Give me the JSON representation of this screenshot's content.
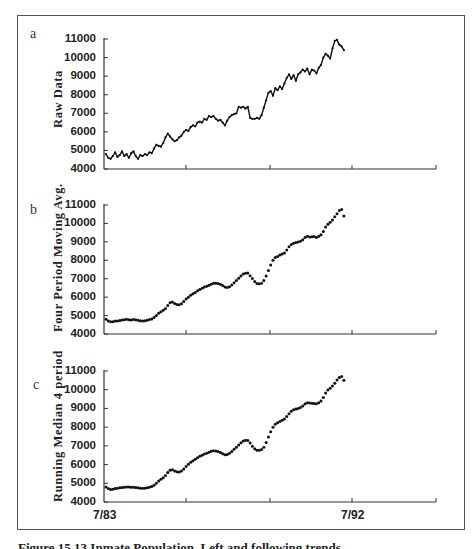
{
  "figure": {
    "caption": "Figure 15.13 Inmate Population, Left and following trends"
  },
  "chart_data": [
    {
      "type": "line",
      "panel": "a",
      "ylabel": "Raw Data",
      "xlabel": "",
      "ylim": [
        4000,
        11000
      ],
      "yticks": [
        4000,
        5000,
        6000,
        7000,
        8000,
        9000,
        10000,
        11000
      ],
      "x_start": "7/83",
      "x_tick_labels": [
        "7/83",
        "",
        "",
        "7/92",
        ""
      ],
      "grid": false,
      "series": [
        {
          "name": "Raw Data",
          "frequency": "monthly",
          "start": "7/83",
          "values": [
            4800,
            4600,
            4550,
            4700,
            4900,
            4650,
            4750,
            4950,
            4700,
            4800,
            4600,
            4850,
            4950,
            4700,
            4550,
            4750,
            4700,
            4800,
            4750,
            4900,
            4850,
            5100,
            5300,
            5250,
            5200,
            5400,
            5700,
            5900,
            5750,
            5600,
            5500,
            5550,
            5700,
            5800,
            6000,
            6100,
            6050,
            6250,
            6350,
            6300,
            6500,
            6550,
            6500,
            6700,
            6650,
            6850,
            6800,
            6850,
            6700,
            6600,
            6650,
            6500,
            6350,
            6600,
            6800,
            6900,
            6950,
            7000,
            7350,
            7300,
            7350,
            7250,
            7350,
            6750,
            6700,
            6700,
            6750,
            6700,
            6900,
            7300,
            7700,
            8100,
            8200,
            7950,
            8350,
            8250,
            8450,
            8300,
            8600,
            8900,
            9100,
            8850,
            9050,
            8750,
            9100,
            9200,
            9350,
            9250,
            9400,
            9100,
            9350,
            9300,
            9150,
            9450,
            9600,
            10000,
            10200,
            10100,
            9950,
            10500,
            10900,
            10950,
            10700,
            10600,
            10400
          ]
        }
      ]
    },
    {
      "type": "scatter",
      "panel": "b",
      "ylabel": "Four Period Moving Avg.",
      "xlabel": "",
      "ylim": [
        4000,
        11000
      ],
      "yticks": [
        4000,
        5000,
        6000,
        7000,
        8000,
        9000,
        10000,
        11000
      ],
      "x_start": "7/83",
      "x_tick_labels": [
        "7/83",
        "",
        "",
        "7/92",
        ""
      ],
      "grid": false,
      "series": [
        {
          "name": "Four Period Moving Avg.",
          "frequency": "monthly",
          "start": "7/83",
          "values": [
            4800,
            4700,
            4660,
            4670,
            4700,
            4700,
            4730,
            4760,
            4780,
            4800,
            4780,
            4760,
            4790,
            4780,
            4740,
            4720,
            4700,
            4720,
            4750,
            4790,
            4820,
            4900,
            5010,
            5120,
            5210,
            5290,
            5390,
            5550,
            5700,
            5730,
            5660,
            5600,
            5590,
            5640,
            5760,
            5900,
            6000,
            6100,
            6190,
            6250,
            6350,
            6420,
            6480,
            6550,
            6590,
            6650,
            6700,
            6760,
            6750,
            6740,
            6700,
            6630,
            6550,
            6530,
            6570,
            6660,
            6780,
            6900,
            7020,
            7150,
            7250,
            7300,
            7310,
            7160,
            7010,
            6850,
            6740,
            6720,
            6760,
            6900,
            7150,
            7450,
            7750,
            8000,
            8150,
            8200,
            8290,
            8340,
            8400,
            8560,
            8730,
            8860,
            8930,
            8960,
            8990,
            9030,
            9110,
            9230,
            9300,
            9270,
            9280,
            9290,
            9230,
            9300,
            9380,
            9560,
            9810,
            9960,
            10060,
            10190,
            10360,
            10530,
            10700,
            10760,
            10400
          ]
        }
      ]
    },
    {
      "type": "scatter",
      "panel": "c",
      "ylabel": "Running Median 4 period",
      "xlabel": "",
      "ylim": [
        4000,
        11000
      ],
      "yticks": [
        4000,
        5000,
        6000,
        7000,
        8000,
        9000,
        10000,
        11000
      ],
      "x_start": "7/83",
      "x_tick_labels": [
        "7/83",
        "",
        "",
        "7/92",
        ""
      ],
      "grid": false,
      "series": [
        {
          "name": "Running Median 4 period",
          "frequency": "monthly",
          "start": "7/83",
          "values": [
            4800,
            4720,
            4670,
            4680,
            4720,
            4740,
            4760,
            4780,
            4790,
            4800,
            4800,
            4790,
            4790,
            4780,
            4760,
            4740,
            4730,
            4740,
            4760,
            4790,
            4830,
            4900,
            5000,
            5120,
            5220,
            5300,
            5420,
            5580,
            5700,
            5720,
            5660,
            5610,
            5600,
            5650,
            5760,
            5900,
            6020,
            6130,
            6210,
            6280,
            6360,
            6440,
            6500,
            6560,
            6610,
            6660,
            6710,
            6740,
            6730,
            6700,
            6650,
            6580,
            6530,
            6540,
            6600,
            6700,
            6820,
            6930,
            7050,
            7170,
            7260,
            7300,
            7290,
            7150,
            6980,
            6850,
            6770,
            6760,
            6800,
            6930,
            7180,
            7470,
            7760,
            8000,
            8160,
            8230,
            8300,
            8370,
            8440,
            8570,
            8720,
            8850,
            8930,
            8970,
            9000,
            9050,
            9130,
            9240,
            9310,
            9290,
            9280,
            9270,
            9250,
            9300,
            9400,
            9580,
            9820,
            9980,
            10080,
            10200,
            10350,
            10520,
            10650,
            10700,
            10500
          ]
        }
      ]
    }
  ]
}
